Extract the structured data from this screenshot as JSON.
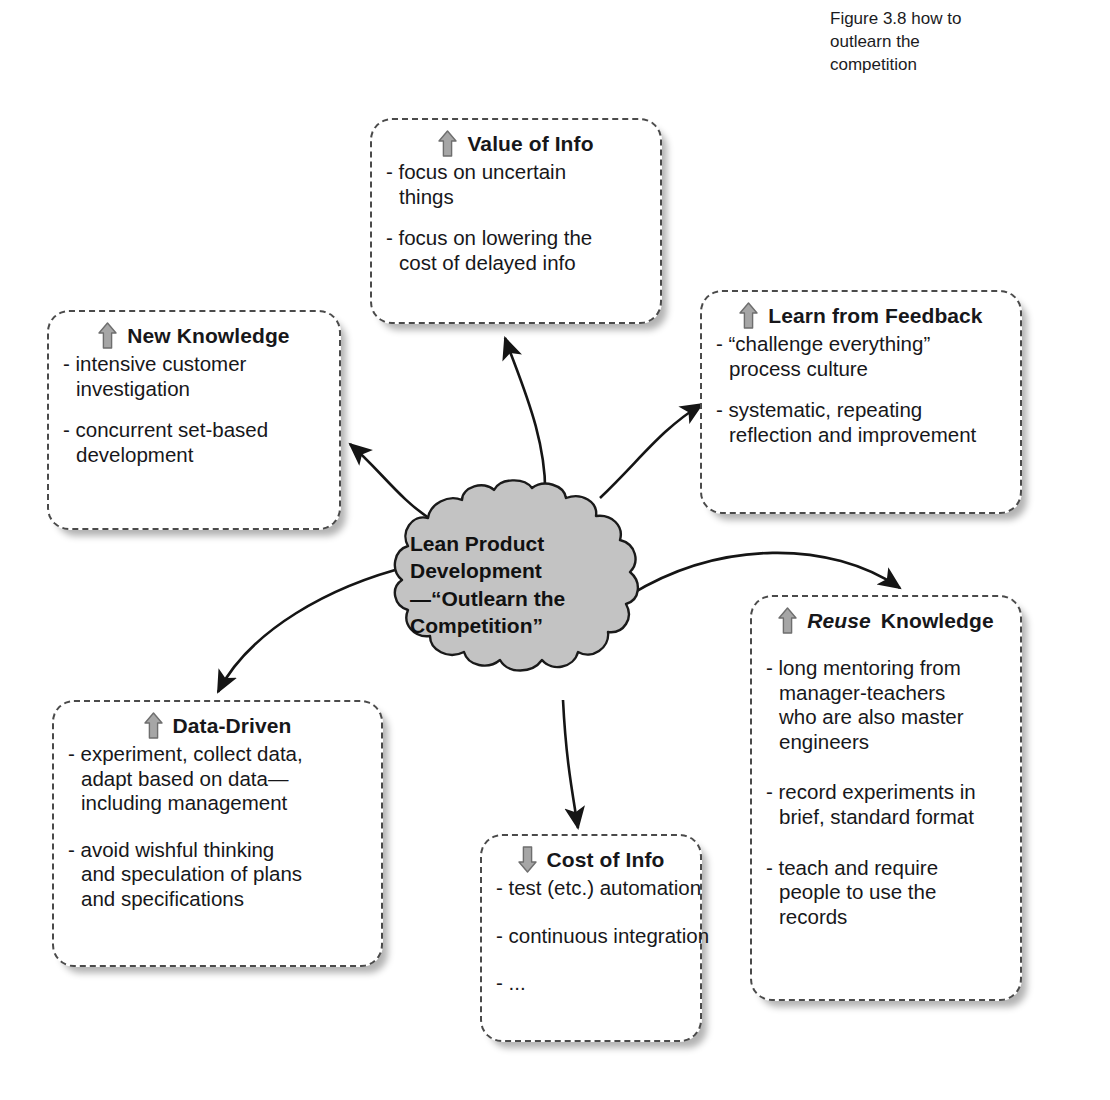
{
  "figure": {
    "caption_lines": [
      "Figure 3.8  how to",
      "outlearn the",
      "competition"
    ]
  },
  "center": {
    "name": "lean-product-development-cloud",
    "lines": [
      "Lean Product",
      "Development",
      "—“Outlearn the",
      "Competition”"
    ],
    "fill_color": "#c3c3c3",
    "stroke_color": "#1a1a1a"
  },
  "arrow_icon_color": "#9a9a9a",
  "nodes": [
    {
      "id": "value-of-info",
      "icon": "up-arrow-icon",
      "direction": "up",
      "title": "Value of Info",
      "title_emphasis": "",
      "bullets": [
        [
          "- focus on uncertain",
          "things"
        ],
        [
          "- focus on lowering the",
          "cost of delayed info"
        ]
      ]
    },
    {
      "id": "new-knowledge",
      "icon": "up-arrow-icon",
      "direction": "up",
      "title": "New Knowledge",
      "title_emphasis": "",
      "bullets": [
        [
          "- intensive customer",
          "investigation"
        ],
        [
          "- concurrent set-based",
          "development"
        ]
      ]
    },
    {
      "id": "learn-from-feedback",
      "icon": "up-arrow-icon",
      "direction": "up",
      "title": "Learn from Feedback",
      "title_emphasis": "",
      "bullets": [
        [
          "- “challenge everything”",
          "process culture"
        ],
        [
          "- systematic, repeating",
          "reflection and improvement"
        ]
      ]
    },
    {
      "id": "data-driven",
      "icon": "up-arrow-icon",
      "direction": "up",
      "title": "Data-Driven",
      "title_emphasis": "",
      "bullets": [
        [
          "- experiment, collect data,",
          "adapt based on data—",
          "including management"
        ],
        [
          "- avoid wishful thinking",
          "and speculation of plans",
          "and specifications"
        ]
      ]
    },
    {
      "id": "cost-of-info",
      "icon": "down-arrow-icon",
      "direction": "down",
      "title": "Cost of Info",
      "title_emphasis": "",
      "bullets": [
        [
          "- test (etc.) automation"
        ],
        [
          "- continuous integration"
        ],
        [
          "- ..."
        ]
      ]
    },
    {
      "id": "reuse-knowledge",
      "icon": "up-arrow-icon",
      "direction": "up",
      "title": "Knowledge",
      "title_emphasis": "Reuse",
      "bullets": [
        [
          "- long mentoring from",
          "manager-teachers",
          "who are also master",
          "engineers"
        ],
        [
          "- record experiments in",
          "brief, standard format"
        ],
        [
          "- teach and require",
          "people to use the",
          "records"
        ]
      ]
    }
  ],
  "connectors": [
    {
      "from": "lean-product-development-cloud",
      "to": "new-knowledge"
    },
    {
      "from": "lean-product-development-cloud",
      "to": "value-of-info"
    },
    {
      "from": "lean-product-development-cloud",
      "to": "learn-from-feedback"
    },
    {
      "from": "lean-product-development-cloud",
      "to": "reuse-knowledge"
    },
    {
      "from": "lean-product-development-cloud",
      "to": "cost-of-info"
    },
    {
      "from": "lean-product-development-cloud",
      "to": "data-driven"
    }
  ]
}
